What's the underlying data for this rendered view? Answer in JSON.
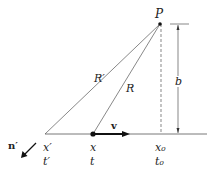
{
  "diagram": {
    "type": "geometry",
    "labels": {
      "point": "P",
      "retarded_distance": "R′",
      "present_distance": "R",
      "impact_parameter": "b",
      "velocity": "v",
      "unit_vector": "n′",
      "retarded_position": "x′",
      "retarded_time": "t′",
      "present_position": "x",
      "present_time": "t",
      "closest_position": "x₀",
      "closest_time": "t₀"
    },
    "colors": {
      "line": "#444444",
      "text": "#222222"
    }
  }
}
